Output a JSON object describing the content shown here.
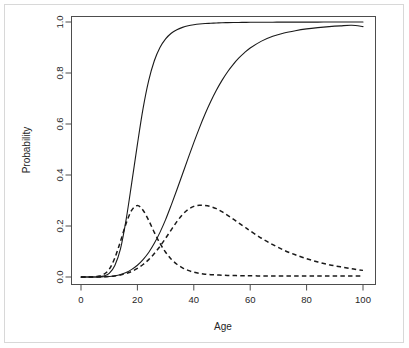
{
  "figure": {
    "background_color": "#ffffff",
    "frame_color": "#d8d8d8",
    "axis_color": "#4d4d4d",
    "curve_color": "#1a1a1a"
  },
  "chart_data": {
    "type": "line",
    "title": "",
    "subtitle": "",
    "xlabel": "Age",
    "ylabel": "Probability",
    "xlim": [
      0,
      100
    ],
    "ylim": [
      0.0,
      1.0
    ],
    "xticks": [
      0,
      20,
      40,
      60,
      80,
      100
    ],
    "xtick_labels": [
      "0",
      "20",
      "40",
      "60",
      "80",
      "100"
    ],
    "yticks": [
      0.0,
      0.2,
      0.4,
      0.6,
      0.8,
      1.0
    ],
    "ytick_labels": [
      "0.0",
      "0.2",
      "0.4",
      "0.6",
      "0.8",
      "1.0"
    ],
    "grid": false,
    "legend": false,
    "legend_position": "none",
    "annotations": [],
    "x": [
      0,
      2,
      4,
      6,
      8,
      10,
      12,
      14,
      16,
      18,
      20,
      22,
      24,
      26,
      28,
      30,
      32,
      34,
      36,
      38,
      40,
      42,
      44,
      46,
      48,
      50,
      52,
      54,
      56,
      58,
      60,
      64,
      68,
      72,
      76,
      80,
      84,
      88,
      92,
      96,
      100
    ],
    "series": [
      {
        "name": "cumulative-early",
        "style": "solid",
        "description": "steep logistic cumulative curve, midpoint near age 20",
        "values": [
          0.0,
          0.0,
          0.0,
          0.001,
          0.004,
          0.014,
          0.045,
          0.11,
          0.225,
          0.37,
          0.52,
          0.66,
          0.77,
          0.848,
          0.9,
          0.934,
          0.956,
          0.97,
          0.979,
          0.985,
          0.989,
          0.992,
          0.994,
          0.995,
          0.996,
          0.997,
          0.9975,
          0.998,
          0.9983,
          0.9986,
          0.9988,
          0.9991,
          0.9993,
          0.9995,
          0.9996,
          0.9997,
          0.9997,
          0.9998,
          0.9998,
          0.9999,
          0.9999
        ]
      },
      {
        "name": "cumulative-late",
        "style": "solid",
        "description": "shallower logistic cumulative curve, midpoint near age 46",
        "values": [
          0.0,
          0.0,
          0.0,
          0.0,
          0.001,
          0.002,
          0.005,
          0.01,
          0.018,
          0.03,
          0.046,
          0.068,
          0.096,
          0.132,
          0.175,
          0.225,
          0.282,
          0.342,
          0.404,
          0.466,
          0.527,
          0.585,
          0.639,
          0.688,
          0.732,
          0.771,
          0.805,
          0.834,
          0.859,
          0.88,
          0.898,
          0.925,
          0.944,
          0.957,
          0.966,
          0.973,
          0.978,
          0.982,
          0.985,
          0.987,
          0.982
        ]
      },
      {
        "name": "density-early",
        "style": "dashed",
        "description": "density peaking about 0.28 near age 20",
        "values": [
          0.0,
          0.0,
          0.0,
          0.003,
          0.01,
          0.03,
          0.075,
          0.14,
          0.21,
          0.262,
          0.28,
          0.262,
          0.222,
          0.175,
          0.132,
          0.097,
          0.07,
          0.05,
          0.036,
          0.026,
          0.019,
          0.014,
          0.011,
          0.009,
          0.008,
          0.007,
          0.006,
          0.006,
          0.005,
          0.005,
          0.005,
          0.004,
          0.004,
          0.004,
          0.004,
          0.004,
          0.004,
          0.004,
          0.004,
          0.004,
          0.004
        ]
      },
      {
        "name": "density-late",
        "style": "dashed",
        "description": "density peaking about 0.28 near age 46",
        "values": [
          0.0,
          0.0,
          0.0,
          0.0,
          0.001,
          0.002,
          0.004,
          0.008,
          0.014,
          0.022,
          0.034,
          0.049,
          0.068,
          0.092,
          0.12,
          0.152,
          0.185,
          0.217,
          0.245,
          0.265,
          0.277,
          0.281,
          0.28,
          0.276,
          0.268,
          0.256,
          0.242,
          0.227,
          0.211,
          0.196,
          0.181,
          0.152,
          0.127,
          0.105,
          0.087,
          0.072,
          0.059,
          0.048,
          0.04,
          0.032,
          0.026
        ]
      }
    ]
  }
}
